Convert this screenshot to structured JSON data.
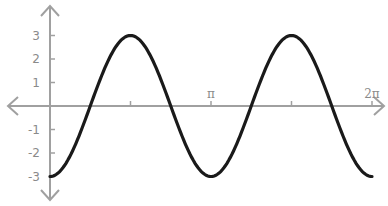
{
  "chart_data": {
    "type": "line",
    "title": "",
    "xlabel": "",
    "ylabel": "",
    "function": "y = -3cos(2x)",
    "x_ticks": [
      {
        "value": 0,
        "label": ""
      },
      {
        "value": 1.5708,
        "label": ""
      },
      {
        "value": 3.1416,
        "label": "π"
      },
      {
        "value": 4.7124,
        "label": ""
      },
      {
        "value": 6.2832,
        "label": "2π"
      }
    ],
    "y_ticks": [
      {
        "value": 3,
        "label": "3"
      },
      {
        "value": 2,
        "label": "2"
      },
      {
        "value": 1,
        "label": "1"
      },
      {
        "value": -1,
        "label": "-1"
      },
      {
        "value": -2,
        "label": "-2"
      },
      {
        "value": -3,
        "label": "-3"
      }
    ],
    "series": [
      {
        "name": "curve",
        "color": "#1a1a1a",
        "x": [
          0,
          0.7854,
          1.5708,
          2.3562,
          3.1416,
          3.927,
          4.7124,
          5.4978,
          6.2832
        ],
        "y": [
          -3,
          0,
          3,
          0,
          -3,
          0,
          3,
          0,
          -3
        ]
      }
    ],
    "xlim": [
      0,
      6.2832
    ],
    "ylim": [
      -3,
      3
    ],
    "grid": false,
    "legend": null
  },
  "colors": {
    "axis": "#a0a0a0",
    "curve": "#1a1a1a",
    "labels": "#8a8a8a"
  }
}
